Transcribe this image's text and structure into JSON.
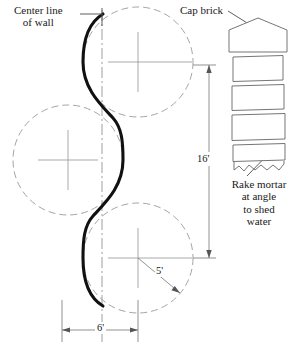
{
  "figure": {
    "type": "engineering-drawing"
  },
  "labels": {
    "center_line": "Center line\nof wall",
    "cap_brick": "Cap brick",
    "rake_mortar": "Rake mortar\nat angle\nto shed\nwater"
  },
  "dimensions": {
    "height": "16'",
    "width": "6'",
    "radius": "5'"
  },
  "colors": {
    "wall_curve": "#111111",
    "construction_line": "#9a9a9a",
    "dimension_line": "#7d7d7d",
    "brick_outline": "#6e6e6e",
    "background": "#ffffff"
  },
  "geometry": {
    "center_line_x": 102,
    "circles": [
      {
        "name": "top-circle",
        "cx": 138,
        "cy": 62,
        "r": 55
      },
      {
        "name": "middle-circle",
        "cx": 68,
        "cy": 160,
        "r": 55
      },
      {
        "name": "bottom-circle",
        "cx": 138,
        "cy": 258,
        "r": 55
      }
    ],
    "vertical_dimension": {
      "x": 209,
      "y1": 65,
      "y2": 258
    },
    "horizontal_dimension": {
      "y": 330,
      "x1": 62,
      "x2": 138
    },
    "brick_column": {
      "x": 232,
      "y_top": 18,
      "width": 54,
      "courses": 4
    }
  }
}
